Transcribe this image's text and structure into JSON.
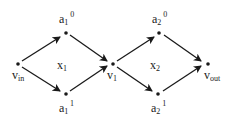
{
  "diagram": {
    "type": "directed-graph",
    "nodes": [
      {
        "id": "v_in",
        "label": "v",
        "sub": "in",
        "sup": "",
        "x": 18,
        "y": 64
      },
      {
        "id": "a1_0",
        "label": "a",
        "sub": "1",
        "sup": "0",
        "x": 66,
        "y": 33
      },
      {
        "id": "a1_1",
        "label": "a",
        "sub": "1",
        "sup": "1",
        "x": 66,
        "y": 94
      },
      {
        "id": "v1",
        "label": "v",
        "sub": "1",
        "sup": "",
        "x": 113,
        "y": 64
      },
      {
        "id": "a2_0",
        "label": "a",
        "sub": "2",
        "sup": "0",
        "x": 159,
        "y": 33
      },
      {
        "id": "a2_1",
        "label": "a",
        "sub": "2",
        "sup": "1",
        "x": 158,
        "y": 94
      },
      {
        "id": "v_out",
        "label": "v",
        "sub": "out",
        "sup": "",
        "x": 208,
        "y": 64
      }
    ],
    "edges": [
      {
        "from": "v_in",
        "to": "a1_0"
      },
      {
        "from": "v_in",
        "to": "a1_1"
      },
      {
        "from": "a1_0",
        "to": "v1"
      },
      {
        "from": "a1_1",
        "to": "v1"
      },
      {
        "from": "v1",
        "to": "a2_0"
      },
      {
        "from": "v1",
        "to": "a2_1"
      },
      {
        "from": "a2_0",
        "to": "v_out"
      },
      {
        "from": "a2_1",
        "to": "v_out"
      }
    ],
    "region_labels": [
      {
        "id": "x1",
        "label": "x",
        "sub": "1"
      },
      {
        "id": "x2",
        "label": "x",
        "sub": "2"
      }
    ],
    "colors": {
      "ink": "#1a1a1a",
      "background": "#ffffff"
    }
  }
}
